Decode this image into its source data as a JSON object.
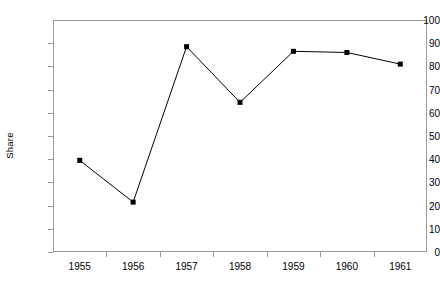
{
  "chart_data": {
    "type": "line",
    "title": "",
    "xlabel": "",
    "ylabel": "Share",
    "categories": [
      "1955",
      "1956",
      "1957",
      "1958",
      "1959",
      "1960",
      "1961"
    ],
    "series": [
      {
        "name": "Share",
        "values": [
          39.5,
          21.5,
          88.5,
          64.5,
          86.5,
          86.0,
          81.0
        ]
      }
    ],
    "ylim": [
      0,
      100
    ],
    "ytick_labels": [
      "0",
      "10",
      "20",
      "30",
      "40",
      "50",
      "60",
      "70",
      "80",
      "90",
      "100"
    ],
    "ytick_values": [
      0,
      10,
      20,
      30,
      40,
      50,
      60,
      70,
      80,
      90,
      100
    ],
    "grid": false,
    "legend": "none",
    "marker": "square",
    "marker_color": "#000000",
    "line_color": "#000000",
    "axis_color": "#9a9a9a",
    "background_color": "#ffffff"
  }
}
